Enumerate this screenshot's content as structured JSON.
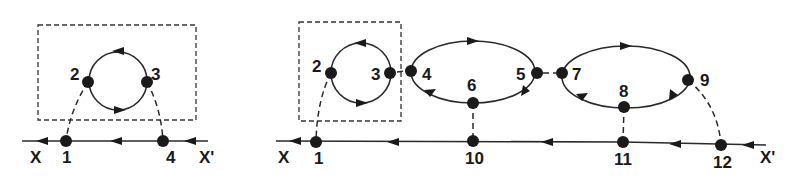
{
  "diagram_left": {
    "axis_left_label": "X",
    "axis_right_label": "X'",
    "nodes": [
      "1",
      "2",
      "3",
      "4"
    ]
  },
  "diagram_right": {
    "axis_left_label": "X",
    "axis_right_label": "X'",
    "nodes": [
      "1",
      "2",
      "3",
      "4",
      "5",
      "6",
      "7",
      "8",
      "9",
      "10",
      "11",
      "12"
    ]
  },
  "colors": {
    "ink": "#1a1a1a",
    "background": "#ffffff"
  }
}
